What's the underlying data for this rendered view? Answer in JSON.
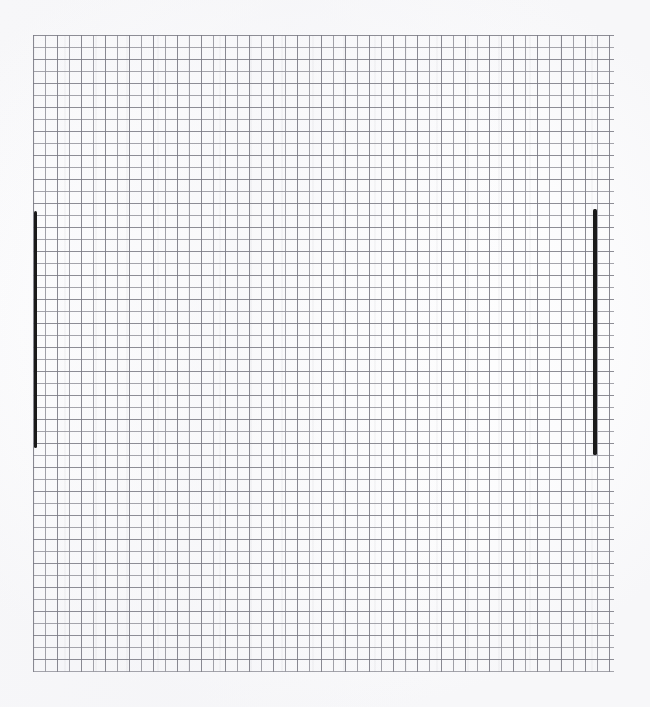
{
  "canvas": {
    "width": 650,
    "height": 707,
    "background_color": "#fefefe",
    "description": "Scanned sheet of square graph paper with two short hand-drawn vertical ink strokes",
    "has_text": false,
    "has_axis_labels": false,
    "has_legend": false
  },
  "grid": {
    "name": "graph-paper-grid",
    "left": 33,
    "top": 35,
    "right": 614,
    "bottom": 672,
    "width": 581,
    "height": 637,
    "cell_size_px": 12,
    "columns": 48,
    "rows": 53,
    "line_color": "#96969e",
    "accent_line_color": "#767680",
    "line_width_px": 1,
    "accent_every_n_cells": 2
  },
  "marks": [
    {
      "name": "left-vertical-stroke",
      "shape": "vertical-line-segment",
      "x": 34,
      "y": 211,
      "width": 3,
      "height": 237,
      "color": "#1a1a1a",
      "grid_column": 0,
      "grid_row_start": 15,
      "grid_row_end": 34
    },
    {
      "name": "right-vertical-stroke",
      "shape": "vertical-line-segment",
      "x": 593,
      "y": 209,
      "width": 4,
      "height": 246,
      "color": "#1a1a1a",
      "grid_column": 47,
      "grid_row_start": 15,
      "grid_row_end": 35
    }
  ],
  "chart_data": {
    "type": "scatter",
    "title": "",
    "subtitle": "",
    "xlabel": "",
    "ylabel": "",
    "grid": true,
    "legend_position": "none",
    "annotations": [],
    "tick_labels": {
      "x": [],
      "y": []
    },
    "xlim": [
      0,
      48
    ],
    "ylim": [
      0,
      53
    ],
    "series": [
      {
        "name": "left-vertical-stroke",
        "type": "line",
        "x": [
          0,
          0
        ],
        "y": [
          38,
          19
        ],
        "color": "#1a1a1a",
        "linewidth": 3
      },
      {
        "name": "right-vertical-stroke",
        "type": "line",
        "x": [
          47,
          47
        ],
        "y": [
          38.5,
          18
        ],
        "color": "#1a1a1a",
        "linewidth": 4
      }
    ]
  }
}
